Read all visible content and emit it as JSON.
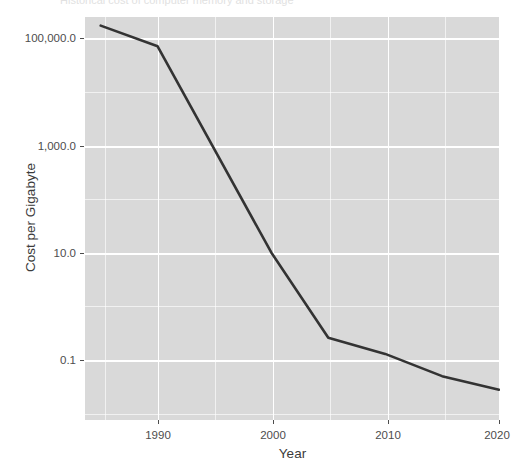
{
  "chart": {
    "title_fragment": "Historical cost of computer memory and storage",
    "axis": {
      "x_label": "Year",
      "y_label": "Cost per Gigabyte"
    },
    "y_ticks": [
      {
        "label": "100,000.0",
        "value": 100000
      },
      {
        "label": "1,000.0",
        "value": 1000
      },
      {
        "label": "10.0",
        "value": 10
      },
      {
        "label": "0.1",
        "value": 0.1
      }
    ],
    "x_ticks": [
      {
        "label": "1990",
        "value": 1990
      },
      {
        "label": "2000",
        "value": 2000
      },
      {
        "label": "2010",
        "value": 2010
      },
      {
        "label": "2020",
        "value": 2020
      }
    ],
    "colors": {
      "panel": "#D9D9D9",
      "gridline": "#FFFFFF",
      "line": "#333333",
      "text": "#4D4D4D",
      "background": "#FFFFFF"
    }
  },
  "chart_data": {
    "type": "line",
    "title": "Historical cost of computer memory and storage",
    "xlabel": "Year",
    "ylabel": "Cost per Gigabyte",
    "xlim": [
      1985,
      2020
    ],
    "ylim": [
      0.028,
      170000
    ],
    "yscale": "log10",
    "grid": true,
    "legend": "none",
    "x": [
      1985,
      1990,
      2000,
      2005,
      2010,
      2015,
      2020
    ],
    "series": [
      {
        "name": "Cost per Gigabyte",
        "values": [
          170000,
          70000,
          10.0,
          0.26,
          0.13,
          0.05,
          0.028
        ]
      }
    ],
    "x_tick_labels": [
      "1990",
      "2000",
      "2010",
      "2020"
    ],
    "y_tick_labels": [
      "100,000.0",
      "1,000.0",
      "10.0",
      "0.1"
    ]
  }
}
